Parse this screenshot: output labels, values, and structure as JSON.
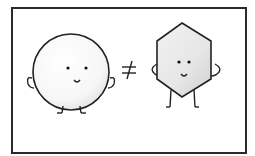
{
  "title_cutoff": "",
  "illustration": {
    "left_character": {
      "shape": "circle",
      "face": "smile"
    },
    "symbol": "≠",
    "right_character": {
      "shape": "hexagon",
      "face": "smile"
    }
  },
  "colors": {
    "stroke": "#222222",
    "fill_light": "#f4f4f4",
    "fill_shade": "#d8d8d8",
    "frame": "#2a2a2a"
  }
}
